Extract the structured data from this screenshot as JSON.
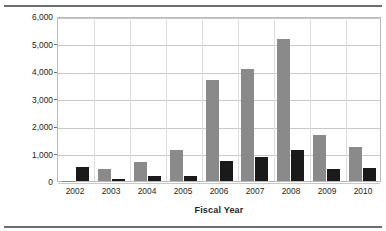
{
  "figure": {
    "clipped_title": "",
    "y_axis_title": "Arrests",
    "x_axis_title": "Fiscal Year"
  },
  "chart_data": {
    "type": "bar",
    "title": "",
    "subtitle": "",
    "xlabel": "Fiscal Year",
    "ylabel": "Arrests",
    "categories": [
      "2002",
      "2003",
      "2004",
      "2005",
      "2006",
      "2007",
      "2008",
      "2009",
      "2010"
    ],
    "series": [
      {
        "name": "gray-series",
        "color": "#8a8a8a",
        "values": [
          10,
          450,
          680,
          1120,
          3670,
          4070,
          5180,
          1660,
          1230
        ]
      },
      {
        "name": "black-series",
        "color": "#1a1a1a",
        "values": [
          500,
          70,
          170,
          180,
          730,
          870,
          1120,
          450,
          460
        ]
      }
    ],
    "ylim": [
      0,
      6000
    ],
    "ytick_values": [
      0,
      1000,
      2000,
      3000,
      4000,
      5000,
      6000
    ],
    "ytick_labels": [
      "0",
      "1,000",
      "2,000",
      "3,000",
      "4,000",
      "5,000",
      "6,000"
    ],
    "grid": true,
    "grid_axis": "both",
    "legend": false,
    "legend_position": "none",
    "bar_group_count": 9,
    "bars_per_group": 2,
    "annotations": []
  },
  "style": {
    "gray": "#8a8a8a",
    "black": "#1a1a1a",
    "gridline": "#c7c8ca",
    "vgridline": "#dcdddf",
    "frame": "#b9babc",
    "rule": "#6d6e71",
    "text": "#231f20",
    "background": "#ffffff"
  }
}
